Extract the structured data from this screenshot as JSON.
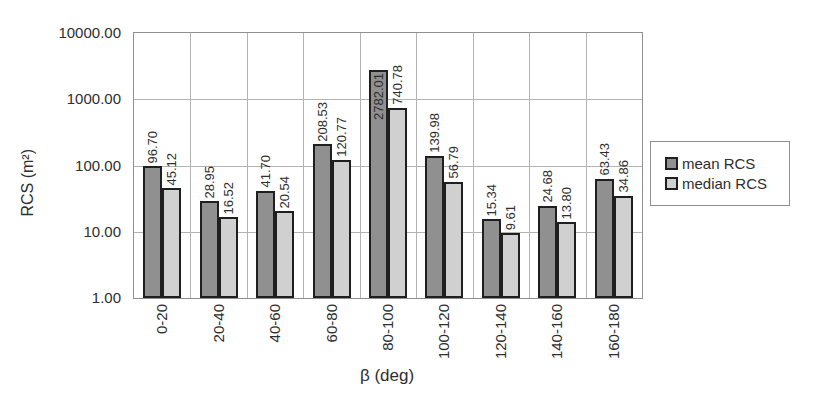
{
  "chart_data": {
    "type": "bar",
    "y_scale": "log10",
    "ylim": [
      1,
      10000
    ],
    "yticks": [
      "10000.00",
      "1000.00",
      "100.00",
      "10.00",
      "1.00"
    ],
    "categories": [
      "0-20",
      "20-40",
      "40-60",
      "60-80",
      "80-100",
      "100-120",
      "120-140",
      "140-160",
      "160-180"
    ],
    "series": [
      {
        "name": "mean RCS",
        "color": "#909090",
        "values": [
          96.7,
          28.95,
          41.7,
          208.53,
          2782.01,
          139.98,
          15.34,
          24.68,
          63.43
        ],
        "labels": [
          "96.70",
          "28.95",
          "41.70",
          "208.53",
          "2782.01",
          "139.98",
          "15.34",
          "24.68",
          "63.43"
        ]
      },
      {
        "name": "median RCS",
        "color": "#d0d0d0",
        "values": [
          45.12,
          16.52,
          20.54,
          120.77,
          740.78,
          56.79,
          9.61,
          13.8,
          34.86
        ],
        "labels": [
          "45.12",
          "16.52",
          "20.54",
          "120.77",
          "740.78",
          "56.79",
          "9.61",
          "13.80",
          "34.86"
        ]
      }
    ],
    "xlabel": "β (deg)",
    "ylabel": "RCS (m²)",
    "grid": true,
    "legend_position": "right"
  },
  "colors": {
    "background": "#ffffff",
    "bar_border": "#1f1f1f",
    "gridline": "#b3b3b3",
    "plot_border": "#8f8f8f",
    "text": "#2e2e2e"
  }
}
